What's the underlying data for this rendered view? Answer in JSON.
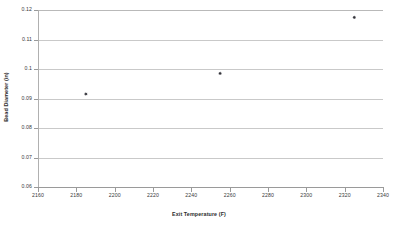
{
  "chart_data": {
    "type": "scatter",
    "title": "",
    "xlabel": "Exit Temperature (F)",
    "ylabel": "Bead Diameter (in)",
    "xlim": [
      2160,
      2340
    ],
    "ylim": [
      0.06,
      0.12
    ],
    "xticks": [
      2160,
      2180,
      2200,
      2220,
      2240,
      2260,
      2280,
      2300,
      2320,
      2340
    ],
    "xtick_labels": [
      "2160",
      "2180",
      "2200",
      "2220",
      "2240",
      "2260",
      "2280",
      "2300",
      "2320",
      "2340"
    ],
    "yticks": [
      0.06,
      0.07,
      0.08,
      0.09,
      0.1,
      0.11,
      0.12
    ],
    "ytick_labels": [
      "0.06",
      "0.07",
      "0.08",
      "0.09",
      "0.1",
      "0.11",
      "0.12"
    ],
    "grid": "horizontal",
    "legend": "none",
    "marker": "diamond",
    "marker_color": "#33333a",
    "gridline_color": "#c9c9c9",
    "series": [
      {
        "name": "Bead Diameter",
        "x": [
          2185,
          2255,
          2325
        ],
        "y": [
          0.0915,
          0.0985,
          0.1175
        ]
      }
    ]
  }
}
